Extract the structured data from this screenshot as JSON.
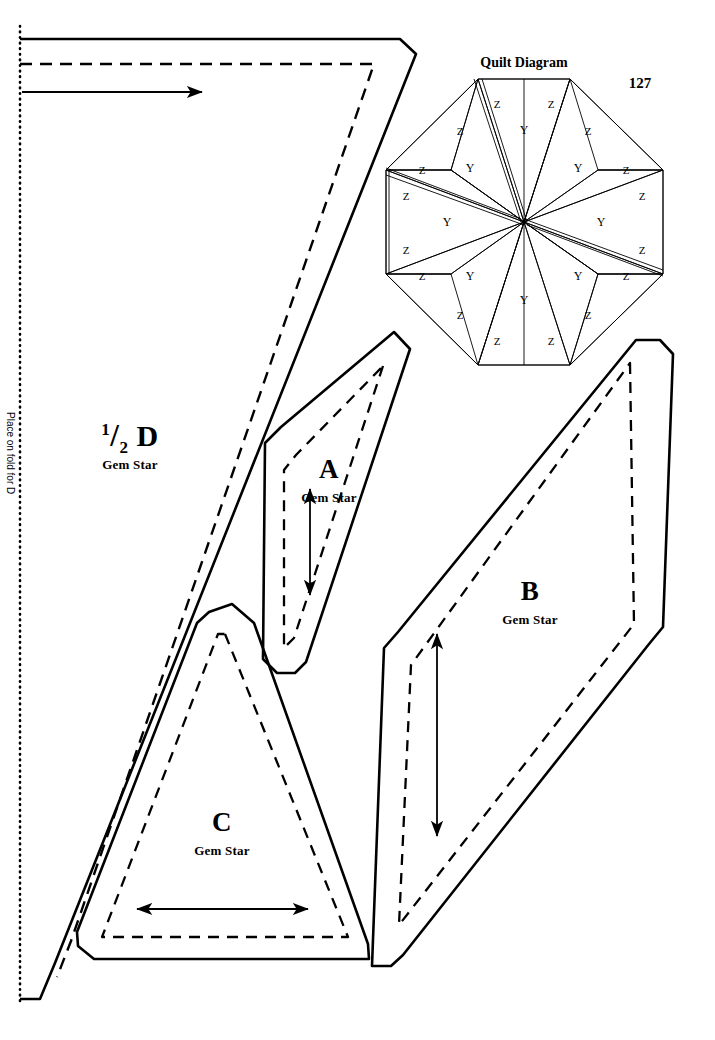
{
  "page": {
    "number": "127",
    "width": 715,
    "height": 1040,
    "pattern_name": "Gem Star"
  },
  "fold_line": {
    "label": "Place on fold for D",
    "style": "dotted",
    "x": 20
  },
  "quilt_diagram": {
    "title": "Quilt Diagram",
    "shape": "octagon",
    "center": [
      524,
      222
    ],
    "radius": 143,
    "patch_codes": {
      "diamond": "Y",
      "triangle": "Z"
    },
    "diamonds": [
      {
        "code": "Y",
        "angle": 90,
        "label_x": 524,
        "label_y": 130
      },
      {
        "code": "Y",
        "angle": 45,
        "label_x": 578,
        "label_y": 168
      },
      {
        "code": "Y",
        "angle": 0,
        "label_x": 601,
        "label_y": 222
      },
      {
        "code": "Y",
        "angle": 315,
        "label_x": 578,
        "label_y": 276
      },
      {
        "code": "Y",
        "angle": 270,
        "label_x": 524,
        "label_y": 300
      },
      {
        "code": "Y",
        "angle": 225,
        "label_x": 470,
        "label_y": 276
      },
      {
        "code": "Y",
        "angle": 180,
        "label_x": 447,
        "label_y": 222
      },
      {
        "code": "Y",
        "angle": 135,
        "label_x": 470,
        "label_y": 168
      }
    ],
    "triangles": [
      {
        "code": "Z",
        "label_x": 497,
        "label_y": 104
      },
      {
        "code": "Z",
        "label_x": 551,
        "label_y": 104
      },
      {
        "code": "Z",
        "label_x": 588,
        "label_y": 131
      },
      {
        "code": "Z",
        "label_x": 626,
        "label_y": 170
      },
      {
        "code": "Z",
        "label_x": 642,
        "label_y": 196
      },
      {
        "code": "Z",
        "label_x": 642,
        "label_y": 250
      },
      {
        "code": "Z",
        "label_x": 626,
        "label_y": 276
      },
      {
        "code": "Z",
        "label_x": 588,
        "label_y": 315
      },
      {
        "code": "Z",
        "label_x": 551,
        "label_y": 341
      },
      {
        "code": "Z",
        "label_x": 497,
        "label_y": 341
      },
      {
        "code": "Z",
        "label_x": 460,
        "label_y": 315
      },
      {
        "code": "Z",
        "label_x": 422,
        "label_y": 276
      },
      {
        "code": "Z",
        "label_x": 406,
        "label_y": 250
      },
      {
        "code": "Z",
        "label_x": 406,
        "label_y": 196
      },
      {
        "code": "Z",
        "label_x": 422,
        "label_y": 170
      },
      {
        "code": "Z",
        "label_x": 460,
        "label_y": 131
      }
    ]
  },
  "templates": [
    {
      "id": "D",
      "letter_prefix_num": "1",
      "letter_prefix_den": "2",
      "letter": "D",
      "sublabel": "Gem Star",
      "label_x": 130,
      "label_y": 440,
      "sub_x": 130,
      "sub_y": 466,
      "grain_direction": "horizontal",
      "grain_arrow": {
        "x1": 22,
        "y1": 92,
        "x2": 205,
        "y2": 92,
        "heads": "end"
      },
      "half_template": true
    },
    {
      "id": "A",
      "letter": "A",
      "sublabel": "Gem Star",
      "label_x": 329,
      "label_y": 472,
      "sub_x": 329,
      "sub_y": 500,
      "grain_direction": "vertical",
      "grain_arrow": {
        "x1": 310,
        "y1": 487,
        "x2": 310,
        "y2": 597,
        "heads": "both"
      }
    },
    {
      "id": "B",
      "letter": "B",
      "sublabel": "Gem Star",
      "label_x": 530,
      "label_y": 594,
      "sub_x": 530,
      "sub_y": 622,
      "grain_direction": "vertical",
      "grain_arrow": {
        "x1": 437,
        "y1": 632,
        "x2": 437,
        "y2": 838,
        "heads": "both"
      }
    },
    {
      "id": "C",
      "letter": "C",
      "sublabel": "Gem Star",
      "label_x": 222,
      "label_y": 825,
      "sub_x": 222,
      "sub_y": 853,
      "grain_direction": "horizontal",
      "grain_arrow": {
        "x1": 135,
        "y1": 909,
        "x2": 310,
        "y2": 909,
        "heads": "both"
      }
    }
  ],
  "line_styles": {
    "cut_line": {
      "name": "solid-cut-line",
      "color": "#000000",
      "width": 2.4
    },
    "seam_line": {
      "name": "dashed-seam-line",
      "color": "#000000",
      "width": 2.2,
      "dash": "11 8"
    },
    "fold_line": {
      "name": "dotted-fold-line",
      "color": "#000000",
      "width": 2.4,
      "dash": "1 4"
    },
    "diagram_line": {
      "name": "diagram-thin-line",
      "color": "#000000",
      "width": 0.9
    }
  }
}
